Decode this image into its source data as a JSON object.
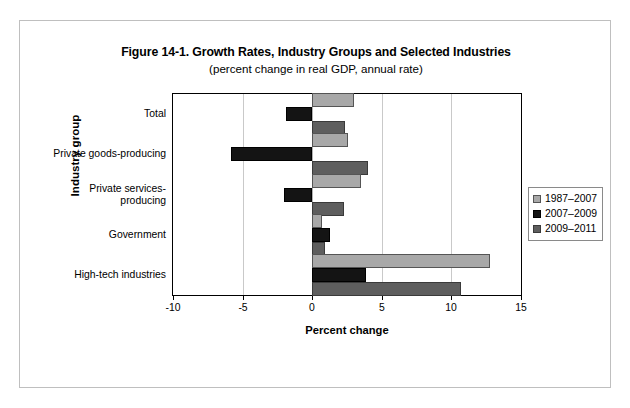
{
  "figure": {
    "title": "Figure 14-1. Growth Rates, Industry Groups and Selected Industries",
    "subtitle": "(percent change in real GDP, annual rate)"
  },
  "axes": {
    "x_title": "Percent change",
    "y_title": "Industry group",
    "x_ticks": [
      "-10",
      "-5",
      "0",
      "5",
      "10",
      "15"
    ]
  },
  "legend": {
    "items": [
      {
        "label": "1987–2007",
        "color": "#a8a8a8"
      },
      {
        "label": "2007–2009",
        "color": "#141414"
      },
      {
        "label": "2009–2011",
        "color": "#5e5e5e"
      }
    ]
  },
  "chart_data": {
    "type": "bar",
    "orientation": "horizontal",
    "title": "Figure 14-1. Growth Rates, Industry Groups and Selected Industries",
    "subtitle": "(percent change in real GDP, annual rate)",
    "xlabel": "Percent change",
    "ylabel": "Industry group",
    "xlim": [
      -10,
      15
    ],
    "xticks": [
      -10,
      -5,
      0,
      5,
      10,
      15
    ],
    "grid": "vertical",
    "legend_position": "right",
    "categories": [
      "Total",
      "Private goods-producing",
      "Private services-producing",
      "Government",
      "High-tech industries"
    ],
    "series": [
      {
        "name": "1987–2007",
        "color": "#a8a8a8",
        "values": [
          3.0,
          2.6,
          3.5,
          0.7,
          12.8
        ]
      },
      {
        "name": "2007–2009",
        "color": "#141414",
        "values": [
          -1.9,
          -5.8,
          -2.0,
          1.3,
          3.9
        ]
      },
      {
        "name": "2009–2011",
        "color": "#5e5e5e",
        "values": [
          2.4,
          4.0,
          2.3,
          0.9,
          10.7
        ]
      }
    ]
  }
}
